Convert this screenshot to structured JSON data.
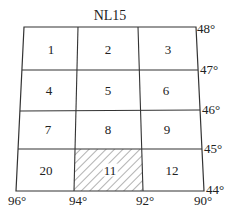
{
  "title": "NL15",
  "cells": [
    {
      "label": "1",
      "x": 51,
      "y": 49,
      "hatched": false
    },
    {
      "label": "2",
      "x": 108,
      "y": 49,
      "hatched": false
    },
    {
      "label": "3",
      "x": 168,
      "y": 49,
      "hatched": false
    },
    {
      "label": "4",
      "x": 49,
      "y": 90,
      "hatched": false
    },
    {
      "label": "5",
      "x": 108,
      "y": 90,
      "hatched": false
    },
    {
      "label": "6",
      "x": 166,
      "y": 90,
      "hatched": false
    },
    {
      "label": "7",
      "x": 48,
      "y": 129,
      "hatched": false
    },
    {
      "label": "8",
      "x": 108,
      "y": 129,
      "hatched": false
    },
    {
      "label": "9",
      "x": 167,
      "y": 129,
      "hatched": false
    },
    {
      "label": "20",
      "x": 46,
      "y": 170,
      "hatched": false
    },
    {
      "label": "11",
      "x": 110,
      "y": 170,
      "hatched": true
    },
    {
      "label": "12",
      "x": 172,
      "y": 170,
      "hatched": false
    }
  ],
  "latitudes": [
    "48°",
    "47°",
    "46°",
    "45°",
    "44°"
  ],
  "longitudes": [
    "96°",
    "94°",
    "92°",
    "90°"
  ],
  "colors": {
    "line": "#333333",
    "hatch": "#555555",
    "background": "#ffffff"
  }
}
